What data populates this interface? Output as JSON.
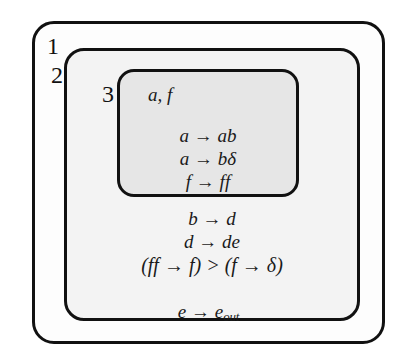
{
  "diagram": {
    "type": "membrane-system",
    "membranes": [
      {
        "id": "membrane-1",
        "label": "1",
        "objects": "",
        "rules": [
          "e → e",
          "out"
        ],
        "rule_lines": [
          {
            "text_before": "e → e",
            "subscript": "out"
          }
        ]
      },
      {
        "id": "membrane-2",
        "label": "2",
        "objects": "",
        "rule_lines": [
          {
            "text_before": "b → d",
            "subscript": ""
          },
          {
            "text_before": "d → de",
            "subscript": ""
          },
          {
            "text_before": "(ff → f) > (f → δ)",
            "subscript": ""
          }
        ]
      },
      {
        "id": "membrane-3",
        "label": "3",
        "objects": "a, f",
        "rule_lines": [
          {
            "text_before": "a → ab",
            "subscript": ""
          },
          {
            "text_before": "a → bδ",
            "subscript": ""
          },
          {
            "text_before": "f → ff",
            "subscript": ""
          }
        ]
      }
    ],
    "colors": {
      "stroke": "#111111",
      "fill_membrane_1": "#fdfdfd",
      "fill_membrane_2": "#f3f3f3",
      "fill_membrane_3": "#e6e6e6",
      "text": "#1a1a1a"
    }
  }
}
